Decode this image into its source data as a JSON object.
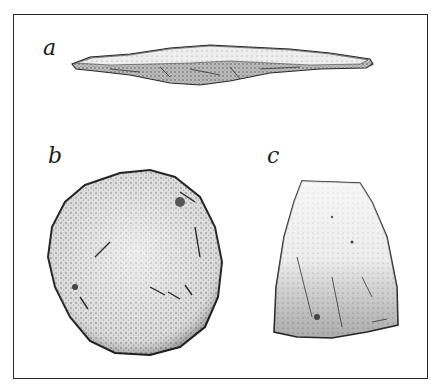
{
  "figure": {
    "panels": [
      {
        "id": "a",
        "label": "a",
        "description": "elongated flint blade, side view"
      },
      {
        "id": "b",
        "label": "b",
        "description": "rounded stone disc / scraper"
      },
      {
        "id": "c",
        "label": "c",
        "description": "trapezoidal stone celt / axe head"
      }
    ]
  },
  "colors": {
    "frame": "#2a2a2a",
    "ink": "#1a1a1a",
    "stone_light": "#e8e8e8",
    "stone_mid": "#bdbdbd",
    "stone_dark": "#6e6e6e"
  }
}
